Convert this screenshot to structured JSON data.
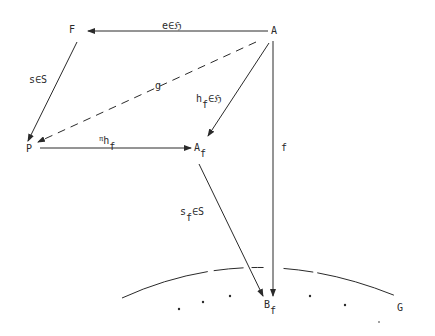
{
  "diagram": {
    "nodes": {
      "F": {
        "label": "F"
      },
      "A": {
        "label": "A"
      },
      "P": {
        "label": "P"
      },
      "Af": {
        "label": "A",
        "sub": "f"
      },
      "Bf": {
        "label": "B",
        "sub": "f"
      },
      "G": {
        "label": "G"
      }
    },
    "edges": {
      "e": {
        "from": "A",
        "to": "F",
        "label": "e∈ℌ",
        "style": "solid"
      },
      "s": {
        "from": "F",
        "to": "P",
        "label": "s∈S",
        "style": "solid"
      },
      "g": {
        "from": "A",
        "to": "P",
        "label": "g",
        "style": "dashed"
      },
      "hf": {
        "from": "A",
        "to": "Af",
        "label_main": "h",
        "label_sub": "f",
        "label_tail": "∈ℌ",
        "style": "solid"
      },
      "pi": {
        "from": "P",
        "to": "Af",
        "label_main": "π",
        "label_h": "h",
        "label_sub": "f",
        "style": "solid"
      },
      "f": {
        "from": "A",
        "to": "Bf",
        "label": "f",
        "style": "solid"
      },
      "sf": {
        "from": "Af",
        "to": "Bf",
        "label_main": "s",
        "label_sub": "f",
        "label_tail": "∈S",
        "style": "solid"
      }
    },
    "region": {
      "label": "G",
      "shape": "dashed-arc-with-dots"
    },
    "colors": {
      "ink": "#2a2a2a",
      "background": "#ffffff"
    }
  }
}
